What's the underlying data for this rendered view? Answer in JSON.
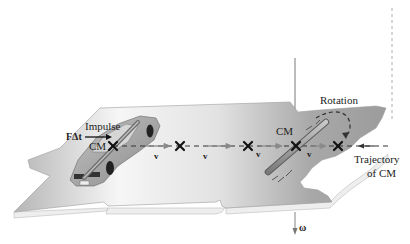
{
  "diagram": {
    "labels": {
      "impulse": "Impulse",
      "force_time": "FΔt",
      "cm_car": "CM",
      "cm_rod": "CM",
      "rotation": "Rotation",
      "trajectory_line1": "Trajectory",
      "trajectory_line2": "of CM",
      "omega": "ω",
      "velocity": [
        "v",
        "v",
        "v",
        "v"
      ]
    },
    "markers": {
      "cm_positions_x": [
        113,
        180,
        248,
        296,
        338
      ],
      "trajectory_y": 146
    },
    "colors": {
      "surface_light": "#f4f4f4",
      "surface_dark": "#a9a9a9",
      "surface_edge": "#ececec",
      "dashed_line": "#333333",
      "marker": "#111111",
      "car_body": "#9a9a9a",
      "rod": "#8c8c8c"
    }
  }
}
